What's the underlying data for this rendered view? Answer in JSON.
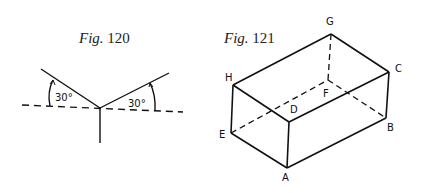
{
  "figures": [
    {
      "caption_prefix": "Fig.",
      "caption_number": "120",
      "angle_labels": [
        "30°",
        "30°"
      ]
    },
    {
      "caption_prefix": "Fig.",
      "caption_number": "121",
      "vertex_labels": {
        "A": "A",
        "B": "B",
        "C": "C",
        "D": "D",
        "E": "E",
        "F": "F",
        "G": "G",
        "H": "H"
      }
    }
  ],
  "colors": {
    "line": "#111111",
    "background": "#ffffff"
  }
}
